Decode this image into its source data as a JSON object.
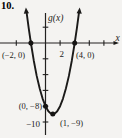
{
  "problem_number": "10.",
  "figure": {
    "y_axis_label": "g(x)",
    "x_axis_label": "x",
    "x_tick_label": "2",
    "y_tick_label": "−10",
    "point_labels": [
      "(−2, 0)",
      "(4, 0)",
      "(0, −8)",
      "(1, −9)"
    ]
  },
  "colors": {
    "background": "#f4f3f1",
    "ink": "#1b1a19"
  },
  "chart_data": {
    "type": "line",
    "title": "",
    "xlabel": "x",
    "ylabel": "g(x)",
    "grid": false,
    "xlim": [
      -6.2,
      10.4
    ],
    "ylim": [
      -12,
      4.5
    ],
    "x_ticks": [
      -4,
      -2,
      2,
      4,
      6,
      8
    ],
    "y_ticks": [
      2,
      -2,
      -4,
      -6,
      -8,
      -10
    ],
    "shown_x_tick_label": "2",
    "shown_y_tick_label": "-10",
    "series": [
      {
        "name": "g",
        "x": [
          -2.6,
          -2.3,
          -2,
          -1.6,
          -1.2,
          -0.8,
          -0.4,
          0,
          0.4,
          0.7,
          1,
          1.3,
          1.6,
          2,
          2.4,
          2.8,
          3.2,
          3.6,
          4,
          4.3,
          4.6
        ],
        "y": [
          3.96,
          1.89,
          0,
          -2.24,
          -4.16,
          -5.76,
          -7.04,
          -8,
          -8.64,
          -8.91,
          -9,
          -8.91,
          -8.64,
          -8,
          -7.04,
          -5.76,
          -4.16,
          -2.24,
          0,
          1.89,
          3.96
        ]
      }
    ],
    "labeled_points": [
      {
        "x": -2,
        "y": 0,
        "label": "(−2, 0)"
      },
      {
        "x": 4,
        "y": 0,
        "label": "(4, 0)"
      },
      {
        "x": 0,
        "y": -8,
        "label": "(0, −8)"
      },
      {
        "x": 1,
        "y": -9,
        "label": "(1, −9)"
      }
    ]
  }
}
